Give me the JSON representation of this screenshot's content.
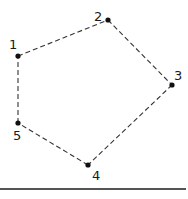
{
  "diagram": {
    "type": "pentagon-dashed",
    "points": [
      {
        "id": "1",
        "label": "1",
        "x": 18,
        "y": 56,
        "lx": 9,
        "ly": 49
      },
      {
        "id": "2",
        "label": "2",
        "x": 108,
        "y": 20,
        "lx": 94,
        "ly": 21
      },
      {
        "id": "3",
        "label": "3",
        "x": 172,
        "y": 85,
        "lx": 174,
        "ly": 80
      },
      {
        "id": "4",
        "label": "4",
        "x": 88,
        "y": 165,
        "lx": 92,
        "ly": 180
      },
      {
        "id": "5",
        "label": "5",
        "x": 18,
        "y": 123,
        "lx": 13,
        "ly": 140
      }
    ],
    "edges": [
      [
        "1",
        "2"
      ],
      [
        "2",
        "3"
      ],
      [
        "3",
        "4"
      ],
      [
        "4",
        "5"
      ],
      [
        "5",
        "1"
      ]
    ],
    "baseline": {
      "x1": 0,
      "x2": 186,
      "y": 189,
      "color": "#555555"
    },
    "colors": {
      "stroke": "#333333",
      "point": "#111111"
    }
  }
}
